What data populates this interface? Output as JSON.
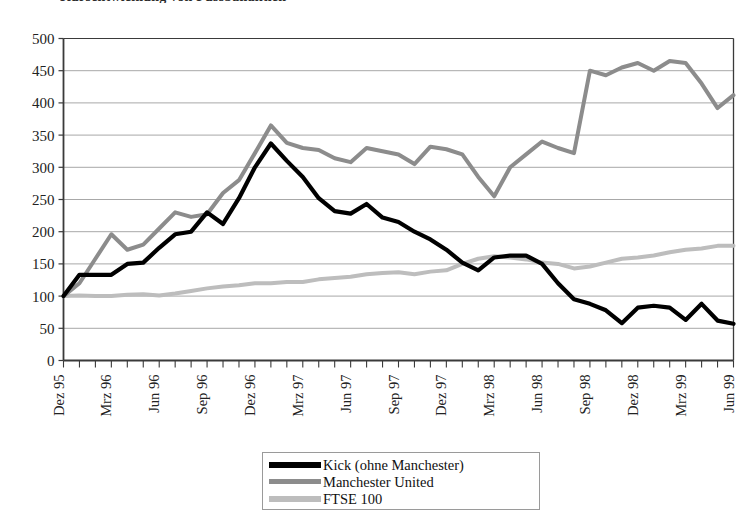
{
  "chart_data": {
    "type": "line",
    "title": "Kursentwicklung von Fussballaktien",
    "xlabel": "",
    "ylabel": "",
    "ylim": [
      0,
      500
    ],
    "ytick_step": 50,
    "yticks": [
      0,
      50,
      100,
      150,
      200,
      250,
      300,
      350,
      400,
      450,
      500
    ],
    "grid": "horizontal",
    "legend_position": "bottom-center",
    "x": [
      "Dez 95",
      "Jan 96",
      "Feb 96",
      "Mrz 96",
      "Apr 96",
      "Mai 96",
      "Jun 96",
      "Jul 96",
      "Aug 96",
      "Sep 96",
      "Okt 96",
      "Nov 96",
      "Dez 96",
      "Jan 97",
      "Feb 97",
      "Mrz 97",
      "Apr 97",
      "Mai 97",
      "Jun 97",
      "Jul 97",
      "Aug 97",
      "Sep 97",
      "Okt 97",
      "Nov 97",
      "Dez 97",
      "Jan 98",
      "Feb 98",
      "Mrz 98",
      "Apr 98",
      "Mai 98",
      "Jun 98",
      "Jul 98",
      "Aug 98",
      "Sep 98",
      "Okt 98",
      "Nov 98",
      "Dez 98",
      "Jan 99",
      "Feb 99",
      "Mrz 99",
      "Apr 99",
      "Mai 99",
      "Jun 99"
    ],
    "xtick_labels": [
      "Dez 95",
      "Mrz 96",
      "Jun 96",
      "Sep 96",
      "Dez 96",
      "Mrz 97",
      "Jun 97",
      "Sep 97",
      "Dez 97",
      "Mrz 98",
      "Jun 98",
      "Sep 98",
      "Dez 98",
      "Mrz 99",
      "Jun 99"
    ],
    "xtick_every": 3,
    "series": [
      {
        "name": "Kick (ohne Manchester)",
        "color": "#000000",
        "width": 4.2,
        "values": [
          100,
          133,
          133,
          133,
          150,
          152,
          175,
          196,
          200,
          230,
          212,
          252,
          300,
          337,
          310,
          285,
          252,
          232,
          228,
          243,
          222,
          215,
          200,
          188,
          172,
          152,
          140,
          160,
          163,
          163,
          150,
          120,
          95,
          88,
          78,
          58,
          82,
          85,
          82,
          63,
          88,
          62,
          57
        ]
      },
      {
        "name": "Manchester United",
        "color": "#8c8c8c",
        "width": 4.0,
        "values": [
          100,
          120,
          158,
          196,
          172,
          180,
          205,
          230,
          223,
          227,
          260,
          280,
          322,
          365,
          338,
          330,
          327,
          314,
          308,
          330,
          325,
          320,
          305,
          332,
          328,
          320,
          285,
          255,
          300,
          320,
          340,
          330,
          322,
          450,
          443,
          455,
          462,
          450,
          465,
          462,
          430,
          392,
          412
        ]
      },
      {
        "name": "FTSE 100",
        "color": "#bdbdbd",
        "width": 4.0,
        "values": [
          100,
          101,
          100,
          100,
          102,
          103,
          101,
          104,
          108,
          112,
          115,
          117,
          120,
          120,
          122,
          122,
          126,
          128,
          130,
          134,
          136,
          137,
          134,
          138,
          140,
          150,
          158,
          162,
          160,
          157,
          152,
          150,
          143,
          146,
          152,
          158,
          160,
          163,
          168,
          172,
          174,
          178,
          178
        ]
      }
    ]
  },
  "legend": {
    "items": [
      {
        "label": "Kick (ohne Manchester)",
        "swatch": "sw-kick"
      },
      {
        "label": "Manchester United",
        "swatch": "sw-manu"
      },
      {
        "label": "FTSE 100",
        "swatch": "sw-ftse"
      }
    ]
  },
  "colors": {
    "kick": "#000000",
    "manchester": "#8c8c8c",
    "ftse": "#bdbdbd",
    "axis": "#3a3a3a",
    "grid": "#9e9e9e",
    "background": "#ffffff"
  }
}
